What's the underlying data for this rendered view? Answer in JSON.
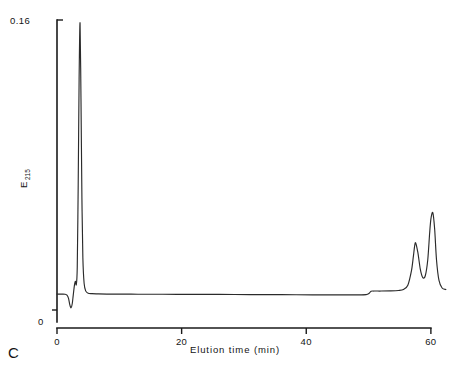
{
  "figure": {
    "panel_label": "C",
    "background_color": "#ffffff",
    "trace_color": "#2b2b2b",
    "axis_color": "#1a1a1a"
  },
  "chart_data": {
    "type": "line",
    "title": "",
    "subtitle": "",
    "panel": "C",
    "xlabel": "Elution time (min)",
    "ylabel": "E",
    "ylabel_subscript": "215",
    "ylabel_full": "E215",
    "xlim": [
      0,
      60.5
    ],
    "ylim": [
      0,
      0.16
    ],
    "x_ticks": [
      0,
      20,
      40,
      60
    ],
    "x_tick_labels": [
      "0",
      "20",
      "40",
      "60"
    ],
    "y_ticks": [
      0,
      0.16
    ],
    "y_tick_labels": [
      "0",
      "0.16"
    ],
    "grid": false,
    "legend": null,
    "baseline_value": 0.0148,
    "annotations": [],
    "peaks": [
      {
        "name": "negative-dip",
        "x": 2.0,
        "y": 0.0075,
        "note": "small negative deflection near injection"
      },
      {
        "name": "pre-peak-bump",
        "x": 2.9,
        "y": 0.0215,
        "note": "small positive bump before main peak"
      },
      {
        "name": "main-peak",
        "x": 3.7,
        "y": 0.1585,
        "note": "tall sharp void/solvent peak"
      },
      {
        "name": "baseline-step",
        "x": 50.4,
        "y": 0.0163,
        "note": "small gradient step in baseline"
      },
      {
        "name": "peak-2",
        "x": 57.5,
        "y": 0.042,
        "note": "resolved component peak"
      },
      {
        "name": "peak-3",
        "x": 60.3,
        "y": 0.058,
        "note": "resolved component peak, taller"
      }
    ],
    "series": [
      {
        "name": "E215 absorbance trace",
        "color": "#2b2b2b",
        "x": [
          0.0,
          0.4,
          0.9,
          1.3,
          1.6,
          1.85,
          2.05,
          2.25,
          2.45,
          2.6,
          2.8,
          2.95,
          3.1,
          3.25,
          3.4,
          3.55,
          3.7,
          3.85,
          4.0,
          4.15,
          4.35,
          4.6,
          5.0,
          5.6,
          6.5,
          8.0,
          10.0,
          13.0,
          17.0,
          21.0,
          26.0,
          31.0,
          36.0,
          41.0,
          45.0,
          48.0,
          49.6,
          50.1,
          50.4,
          50.9,
          52.0,
          53.5,
          54.8,
          55.6,
          56.3,
          56.9,
          57.2,
          57.5,
          57.9,
          58.3,
          58.7,
          59.1,
          59.5,
          59.8,
          60.0,
          60.3,
          60.6,
          60.9,
          61.3,
          61.8,
          62.4
        ],
        "y": [
          0.0148,
          0.0148,
          0.0148,
          0.0147,
          0.0142,
          0.0125,
          0.0092,
          0.0075,
          0.0098,
          0.014,
          0.0195,
          0.0215,
          0.0198,
          0.029,
          0.072,
          0.129,
          0.1585,
          0.118,
          0.065,
          0.034,
          0.0205,
          0.0165,
          0.0152,
          0.015,
          0.0149,
          0.0148,
          0.0148,
          0.0147,
          0.0147,
          0.0146,
          0.0146,
          0.0145,
          0.0145,
          0.0144,
          0.0144,
          0.0144,
          0.0145,
          0.0152,
          0.0163,
          0.0164,
          0.0164,
          0.0165,
          0.0167,
          0.0172,
          0.0195,
          0.0275,
          0.035,
          0.042,
          0.037,
          0.028,
          0.0235,
          0.0245,
          0.033,
          0.047,
          0.0545,
          0.058,
          0.0495,
          0.033,
          0.022,
          0.018,
          0.0172
        ]
      }
    ]
  }
}
